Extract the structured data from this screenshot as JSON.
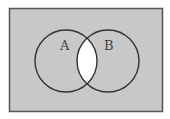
{
  "diagram": {
    "type": "venn",
    "shaded_region": "complement of A ∩ B",
    "colors": {
      "shade": "#c8c8c8",
      "unshaded": "#ffffff",
      "stroke": "#333333"
    },
    "universe": {
      "x": 9,
      "y": 8,
      "width": 154,
      "height": 104
    },
    "sets": [
      {
        "label": "A",
        "cx": 66,
        "cy": 61,
        "r": 31,
        "label_x": 62,
        "label_y": 48
      },
      {
        "label": "B",
        "cx": 108,
        "cy": 61,
        "r": 31,
        "label_x": 105,
        "label_y": 48
      }
    ]
  }
}
